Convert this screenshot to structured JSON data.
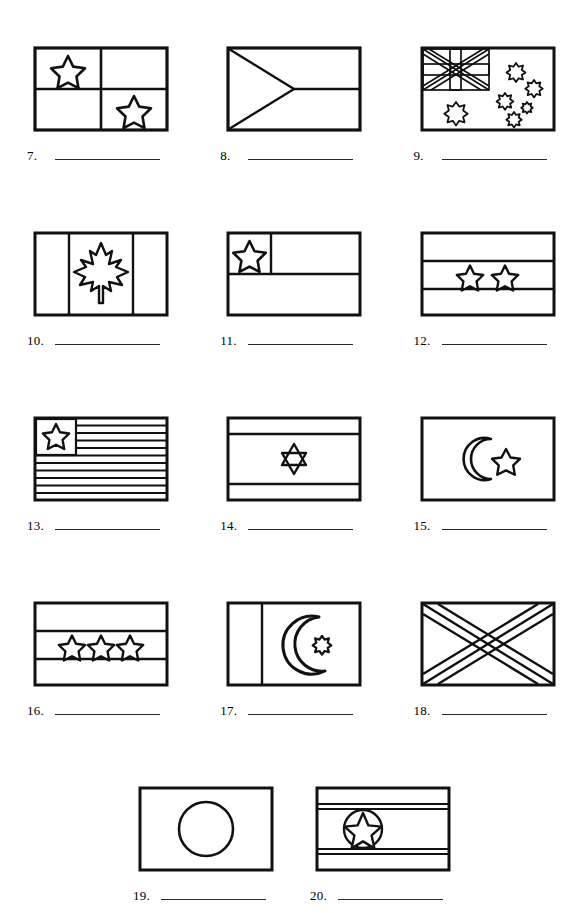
{
  "worksheet": {
    "title": "Flags of the World Identification Worksheet",
    "background_color": "#ffffff",
    "ink_color": "#111111",
    "blank_line_color": "#2a2a2a"
  },
  "rows": [
    {
      "items": [
        {
          "number": "7.",
          "blank_value": "",
          "icon": "flag-quartered-two-stars",
          "description": "Rectangular flag divided into four quadrants with a five-pointed star in the upper-left quadrant and a five-pointed star in the lower-right quadrant"
        },
        {
          "number": "8.",
          "blank_value": "",
          "icon": "flag-two-bands-hoist-triangle",
          "description": "Rectangular flag with two horizontal bands and a triangle extending from the hoist to the center"
        },
        {
          "number": "9.",
          "blank_value": "",
          "icon": "flag-union-jack-canton-southern-cross",
          "description": "Rectangular flag with a Union Jack canton in the upper hoist, a large seven-pointed star below the canton, and five stars of the Southern Cross in the fly"
        }
      ]
    },
    {
      "items": [
        {
          "number": "10.",
          "blank_value": "",
          "icon": "flag-maple-leaf-vertical-bands",
          "description": "Rectangular flag with two vertical side bands and a maple leaf centered in the middle panel"
        },
        {
          "number": "11.",
          "blank_value": "",
          "icon": "flag-canton-star-two-bands",
          "description": "Rectangular flag with two horizontal bands and a square canton containing one five-pointed star"
        },
        {
          "number": "12.",
          "blank_value": "",
          "icon": "flag-three-bands-two-stars",
          "description": "Rectangular flag with three horizontal bands and two five-pointed stars in the middle band"
        }
      ]
    },
    {
      "items": [
        {
          "number": "13.",
          "blank_value": "",
          "icon": "flag-eleven-stripes-canton-star",
          "description": "Rectangular flag with eleven horizontal stripes and a canton containing one five-pointed star"
        },
        {
          "number": "14.",
          "blank_value": "",
          "icon": "flag-two-bands-star-of-david",
          "description": "Rectangular flag with two horizontal bands near the top and bottom and a six-pointed Star of David in the center"
        },
        {
          "number": "15.",
          "blank_value": "",
          "icon": "flag-crescent-and-star",
          "description": "Plain rectangular flag with a crescent moon and a five-pointed star centered"
        }
      ]
    },
    {
      "items": [
        {
          "number": "16.",
          "blank_value": "",
          "icon": "flag-three-bands-three-stars",
          "description": "Rectangular flag with three horizontal bands and three five-pointed stars in the middle band"
        },
        {
          "number": "17.",
          "blank_value": "",
          "icon": "flag-hoist-band-crescent-star",
          "description": "Rectangular flag with a vertical white band at the hoist and a large crescent moon with a small star in the fly"
        },
        {
          "number": "18.",
          "blank_value": "",
          "icon": "flag-saltire-diagonal-cross",
          "description": "Rectangular flag with a diagonal saltire cross spanning corner to corner"
        }
      ]
    },
    {
      "items": [
        {
          "number": "19.",
          "blank_value": "",
          "icon": "flag-centered-disc",
          "description": "Plain rectangular flag with a single large circle centered"
        },
        {
          "number": "20.",
          "blank_value": "",
          "icon": "flag-stripes-star-in-circle",
          "description": "Rectangular flag with horizontal stripes near the top and bottom and a five-pointed star inside a circle toward the hoist"
        }
      ]
    }
  ]
}
